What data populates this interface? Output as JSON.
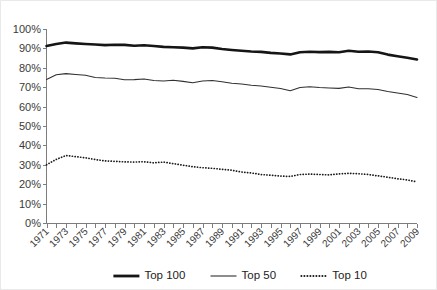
{
  "chart_data": {
    "type": "line",
    "title": "",
    "xlabel": "",
    "ylabel": "",
    "grid": false,
    "legend_position": "bottom",
    "ylim": [
      0,
      100
    ],
    "xlim": [
      1971,
      2009
    ],
    "y_ticks": [
      "0%",
      "10%",
      "20%",
      "30%",
      "40%",
      "50%",
      "60%",
      "70%",
      "80%",
      "90%",
      "100%"
    ],
    "y_tick_values": [
      0,
      10,
      20,
      30,
      40,
      50,
      60,
      70,
      80,
      90,
      100
    ],
    "x": [
      1971,
      1972,
      1973,
      1974,
      1975,
      1976,
      1977,
      1978,
      1979,
      1980,
      1981,
      1982,
      1983,
      1984,
      1985,
      1986,
      1987,
      1988,
      1989,
      1990,
      1991,
      1992,
      1993,
      1994,
      1995,
      1996,
      1997,
      1998,
      1999,
      2000,
      2001,
      2002,
      2003,
      2004,
      2005,
      2006,
      2007,
      2008,
      2009
    ],
    "x_tick_labels": [
      "1971",
      "1973",
      "1975",
      "1977",
      "1979",
      "1981",
      "1983",
      "1985",
      "1987",
      "1989",
      "1991",
      "1993",
      "1995",
      "1997",
      "1999",
      "2001",
      "2003",
      "2005",
      "2007",
      "2009"
    ],
    "series": [
      {
        "name": "Top 100",
        "style": "thick-solid",
        "values": [
          91.2,
          92.3,
          93.0,
          92.6,
          92.3,
          92.0,
          91.7,
          91.9,
          91.8,
          91.4,
          91.6,
          91.2,
          90.8,
          90.6,
          90.4,
          90.0,
          90.6,
          90.4,
          89.7,
          89.2,
          88.8,
          88.4,
          88.2,
          87.7,
          87.4,
          86.9,
          88.0,
          88.3,
          88.1,
          88.2,
          88.0,
          88.8,
          88.3,
          88.4,
          88.0,
          86.8,
          86.0,
          85.2,
          84.3
        ]
      },
      {
        "name": "Top 50",
        "style": "thin-solid",
        "values": [
          74.0,
          76.4,
          77.0,
          76.6,
          76.2,
          75.0,
          74.7,
          74.6,
          73.8,
          73.9,
          74.2,
          73.5,
          73.2,
          73.6,
          73.0,
          72.3,
          73.2,
          73.5,
          72.8,
          72.0,
          71.6,
          71.0,
          70.6,
          70.0,
          69.3,
          68.2,
          69.8,
          70.2,
          69.8,
          69.6,
          69.4,
          70.1,
          69.2,
          69.2,
          68.8,
          67.8,
          67.0,
          66.2,
          64.7
        ]
      },
      {
        "name": "Top 10",
        "style": "dotted",
        "values": [
          30.0,
          32.8,
          34.8,
          34.2,
          33.6,
          32.7,
          32.0,
          31.8,
          31.5,
          31.4,
          31.6,
          31.0,
          31.4,
          30.6,
          29.8,
          29.0,
          28.5,
          28.2,
          27.7,
          27.2,
          26.3,
          25.8,
          25.0,
          24.6,
          24.2,
          24.0,
          25.0,
          25.2,
          25.0,
          24.8,
          25.3,
          25.6,
          25.4,
          25.0,
          24.3,
          23.6,
          22.8,
          22.2,
          21.2
        ]
      }
    ],
    "legend": [
      {
        "label": "Top 100",
        "style": "thick-solid"
      },
      {
        "label": "Top 50",
        "style": "thin-solid"
      },
      {
        "label": "Top 10",
        "style": "dotted"
      }
    ]
  }
}
